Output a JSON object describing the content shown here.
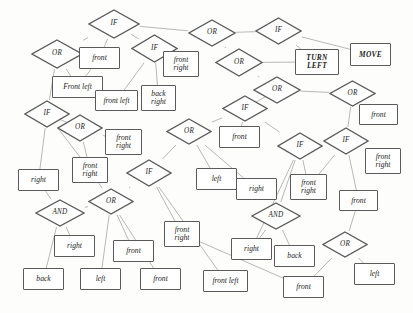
{
  "diagram": {
    "background_color": "#fdfdfc",
    "node_stroke_color": "#5a5a5a",
    "edge_stroke_color": "#9a9a9a",
    "text_color": "#1c1c1c",
    "width": 413,
    "height": 313,
    "nodes": [
      {
        "id": "n1",
        "label": "IF",
        "shape": "diamond",
        "x": 88,
        "y": 9,
        "w": 52,
        "h": 30
      },
      {
        "id": "n2",
        "label": "OR",
        "shape": "diamond",
        "x": 31,
        "y": 39,
        "w": 52,
        "h": 30
      },
      {
        "id": "n3",
        "label": "front",
        "shape": "rect",
        "x": 79,
        "y": 47,
        "w": 41,
        "h": 22
      },
      {
        "id": "n4",
        "label": "IF",
        "shape": "diamond",
        "x": 131,
        "y": 34,
        "w": 47,
        "h": 29
      },
      {
        "id": "n5",
        "label": "OR",
        "shape": "diamond",
        "x": 188,
        "y": 19,
        "w": 48,
        "h": 28
      },
      {
        "id": "n6",
        "label": "IF",
        "shape": "diamond",
        "x": 255,
        "y": 17,
        "w": 47,
        "h": 28
      },
      {
        "id": "n7",
        "label": "front\nright",
        "shape": "rect",
        "x": 163,
        "y": 51,
        "w": 36,
        "h": 26
      },
      {
        "id": "n8",
        "label": "OR",
        "shape": "diamond",
        "x": 215,
        "y": 48,
        "w": 48,
        "h": 29
      },
      {
        "id": "n9",
        "label": "TURN\nLEFT",
        "shape": "rect",
        "x": 295,
        "y": 49,
        "w": 44,
        "h": 26,
        "action": true
      },
      {
        "id": "n10",
        "label": "MOVE",
        "shape": "rect",
        "x": 350,
        "y": 43,
        "w": 41,
        "h": 23,
        "action": true
      },
      {
        "id": "n11",
        "label": "Front left",
        "shape": "rect",
        "x": 52,
        "y": 76,
        "w": 51,
        "h": 22
      },
      {
        "id": "n12",
        "label": "front left",
        "shape": "rect",
        "x": 95,
        "y": 90,
        "w": 43,
        "h": 21
      },
      {
        "id": "n13",
        "label": "back\nright",
        "shape": "rect",
        "x": 141,
        "y": 85,
        "w": 35,
        "h": 26
      },
      {
        "id": "n14",
        "label": "OR",
        "shape": "diamond",
        "x": 253,
        "y": 76,
        "w": 48,
        "h": 28
      },
      {
        "id": "n15",
        "label": "OR",
        "shape": "diamond",
        "x": 329,
        "y": 80,
        "w": 47,
        "h": 27
      },
      {
        "id": "n16",
        "label": "IF",
        "shape": "diamond",
        "x": 24,
        "y": 100,
        "w": 46,
        "h": 28
      },
      {
        "id": "n17",
        "label": "OR",
        "shape": "diamond",
        "x": 57,
        "y": 114,
        "w": 46,
        "h": 28
      },
      {
        "id": "n18",
        "label": "IF",
        "shape": "diamond",
        "x": 222,
        "y": 95,
        "w": 46,
        "h": 27
      },
      {
        "id": "n19",
        "label": "front",
        "shape": "rect",
        "x": 359,
        "y": 104,
        "w": 39,
        "h": 21
      },
      {
        "id": "n20",
        "label": "front\nright",
        "shape": "rect",
        "x": 105,
        "y": 129,
        "w": 37,
        "h": 26
      },
      {
        "id": "n21",
        "label": "OR",
        "shape": "diamond",
        "x": 166,
        "y": 118,
        "w": 46,
        "h": 27
      },
      {
        "id": "n22",
        "label": "front",
        "shape": "rect",
        "x": 219,
        "y": 126,
        "w": 41,
        "h": 22
      },
      {
        "id": "n23",
        "label": "IF",
        "shape": "diamond",
        "x": 277,
        "y": 132,
        "w": 46,
        "h": 28
      },
      {
        "id": "n24",
        "label": "IF",
        "shape": "diamond",
        "x": 323,
        "y": 127,
        "w": 46,
        "h": 28
      },
      {
        "id": "n25",
        "label": "front\nright",
        "shape": "rect",
        "x": 365,
        "y": 148,
        "w": 36,
        "h": 26
      },
      {
        "id": "n26",
        "label": "front\nright",
        "shape": "rect",
        "x": 72,
        "y": 157,
        "w": 36,
        "h": 26
      },
      {
        "id": "n27",
        "label": "IF",
        "shape": "diamond",
        "x": 126,
        "y": 159,
        "w": 46,
        "h": 28
      },
      {
        "id": "n28",
        "label": "right",
        "shape": "rect",
        "x": 18,
        "y": 169,
        "w": 41,
        "h": 22
      },
      {
        "id": "n29",
        "label": "left",
        "shape": "rect",
        "x": 196,
        "y": 168,
        "w": 41,
        "h": 22
      },
      {
        "id": "n30",
        "label": "right",
        "shape": "rect",
        "x": 236,
        "y": 178,
        "w": 41,
        "h": 22
      },
      {
        "id": "n31",
        "label": "front\nright",
        "shape": "rect",
        "x": 290,
        "y": 174,
        "w": 37,
        "h": 26
      },
      {
        "id": "n32",
        "label": "front",
        "shape": "rect",
        "x": 339,
        "y": 190,
        "w": 39,
        "h": 21
      },
      {
        "id": "n33",
        "label": "OR",
        "shape": "diamond",
        "x": 88,
        "y": 188,
        "w": 46,
        "h": 27
      },
      {
        "id": "n34",
        "label": "AND",
        "shape": "diamond",
        "x": 35,
        "y": 199,
        "w": 50,
        "h": 28
      },
      {
        "id": "n35",
        "label": "AND",
        "shape": "diamond",
        "x": 251,
        "y": 202,
        "w": 50,
        "h": 28
      },
      {
        "id": "n36",
        "label": "front\nright",
        "shape": "rect",
        "x": 164,
        "y": 221,
        "w": 36,
        "h": 26
      },
      {
        "id": "n37",
        "label": "right",
        "shape": "rect",
        "x": 54,
        "y": 235,
        "w": 41,
        "h": 22
      },
      {
        "id": "n38",
        "label": "front",
        "shape": "rect",
        "x": 113,
        "y": 240,
        "w": 41,
        "h": 22
      },
      {
        "id": "n39",
        "label": "right",
        "shape": "rect",
        "x": 231,
        "y": 238,
        "w": 41,
        "h": 22
      },
      {
        "id": "n40",
        "label": "back",
        "shape": "rect",
        "x": 274,
        "y": 245,
        "w": 41,
        "h": 22
      },
      {
        "id": "n41",
        "label": "OR",
        "shape": "diamond",
        "x": 322,
        "y": 231,
        "w": 46,
        "h": 27
      },
      {
        "id": "n42",
        "label": "back",
        "shape": "rect",
        "x": 23,
        "y": 268,
        "w": 41,
        "h": 22
      },
      {
        "id": "n43",
        "label": "left",
        "shape": "rect",
        "x": 80,
        "y": 268,
        "w": 41,
        "h": 22
      },
      {
        "id": "n44",
        "label": "front",
        "shape": "rect",
        "x": 140,
        "y": 268,
        "w": 41,
        "h": 22
      },
      {
        "id": "n45",
        "label": "front left",
        "shape": "rect",
        "x": 203,
        "y": 270,
        "w": 45,
        "h": 22
      },
      {
        "id": "n46",
        "label": "front",
        "shape": "rect",
        "x": 283,
        "y": 276,
        "w": 41,
        "h": 22
      },
      {
        "id": "n47",
        "label": "left",
        "shape": "rect",
        "x": 354,
        "y": 263,
        "w": 41,
        "h": 22
      }
    ],
    "edges": [
      {
        "from": "n1",
        "to": "n2"
      },
      {
        "from": "n1",
        "to": "n3"
      },
      {
        "from": "n1",
        "to": "n4"
      },
      {
        "from": "n2",
        "to": "n11"
      },
      {
        "from": "n2",
        "to": "n16"
      },
      {
        "from": "n3",
        "to": "n11"
      },
      {
        "from": "n4",
        "to": "n7"
      },
      {
        "from": "n4",
        "to": "n12"
      },
      {
        "from": "n4",
        "to": "n13"
      },
      {
        "from": "n5",
        "to": "n1"
      },
      {
        "from": "n5",
        "to": "n8"
      },
      {
        "from": "n5",
        "to": "n6"
      },
      {
        "from": "n6",
        "to": "n9"
      },
      {
        "from": "n6",
        "to": "n10"
      },
      {
        "from": "n8",
        "to": "n14"
      },
      {
        "from": "n8",
        "to": "n9"
      },
      {
        "from": "n14",
        "to": "n18"
      },
      {
        "from": "n14",
        "to": "n15"
      },
      {
        "from": "n15",
        "to": "n19"
      },
      {
        "from": "n15",
        "to": "n24"
      },
      {
        "from": "n16",
        "to": "n17"
      },
      {
        "from": "n16",
        "to": "n28"
      },
      {
        "from": "n16",
        "to": "n26"
      },
      {
        "from": "n17",
        "to": "n20"
      },
      {
        "from": "n17",
        "to": "n26"
      },
      {
        "from": "n18",
        "to": "n22"
      },
      {
        "from": "n18",
        "to": "n21"
      },
      {
        "from": "n18",
        "to": "n23"
      },
      {
        "from": "n21",
        "to": "n29"
      },
      {
        "from": "n21",
        "to": "n30"
      },
      {
        "from": "n21",
        "to": "n27"
      },
      {
        "from": "n23",
        "to": "n31"
      },
      {
        "from": "n23",
        "to": "n35"
      },
      {
        "from": "n23",
        "to": "n39"
      },
      {
        "from": "n24",
        "to": "n25"
      },
      {
        "from": "n24",
        "to": "n32"
      },
      {
        "from": "n24",
        "to": "n31"
      },
      {
        "from": "n26",
        "to": "n33"
      },
      {
        "from": "n27",
        "to": "n33"
      },
      {
        "from": "n27",
        "to": "n36"
      },
      {
        "from": "n27",
        "to": "n45"
      },
      {
        "from": "n28",
        "to": "n34"
      },
      {
        "from": "n33",
        "to": "n34"
      },
      {
        "from": "n33",
        "to": "n38"
      },
      {
        "from": "n33",
        "to": "n43"
      },
      {
        "from": "n33",
        "to": "n44"
      },
      {
        "from": "n34",
        "to": "n37"
      },
      {
        "from": "n34",
        "to": "n42"
      },
      {
        "from": "n35",
        "to": "n39"
      },
      {
        "from": "n35",
        "to": "n40"
      },
      {
        "from": "n36",
        "to": "n46"
      },
      {
        "from": "n41",
        "to": "n46"
      },
      {
        "from": "n41",
        "to": "n47"
      },
      {
        "from": "n32",
        "to": "n41"
      }
    ]
  }
}
